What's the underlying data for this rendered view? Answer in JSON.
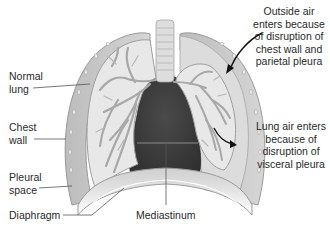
{
  "diagram": {
    "type": "anatomical-illustration",
    "colors": {
      "mediastinum": "#3a3a3a",
      "lung_tissue": "#e6e6e6",
      "airway": "#a8a8a8",
      "pleural_air": "#d9d9d9",
      "chest_wall": "#c4c4c4",
      "diaphragm": "#bdbdbd",
      "leader_line": "#555555",
      "arrow": "#111111"
    }
  },
  "labels": {
    "normal_lung": [
      "Normal",
      "lung"
    ],
    "chest_wall": [
      "Chest",
      "wall"
    ],
    "pleural_space": [
      "Pleural",
      "space"
    ],
    "diaphragm": [
      "Diaphragm"
    ],
    "mediastinum": [
      "Mediastinum"
    ],
    "outside_air": [
      "Outside air",
      "enters because",
      "of disruption of",
      "chest wall and",
      "parietal pleura"
    ],
    "lung_air": [
      "Lung air enters",
      "because of",
      "disruption of",
      "visceral pleura"
    ]
  }
}
